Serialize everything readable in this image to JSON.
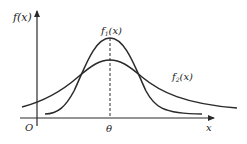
{
  "diagram": {
    "type": "normal-distribution-comparison",
    "y_axis_label": "f(x)",
    "x_axis_label": "x",
    "origin_label": "O",
    "mean_label": "θ",
    "curves": [
      {
        "name": "f1",
        "label_main": "f",
        "label_sub": "1",
        "label_tail": "(x)",
        "description": "taller, narrower bell curve centered at θ"
      },
      {
        "name": "f2",
        "label_main": "f",
        "label_sub": "2",
        "label_tail": "(x)",
        "description": "shorter, wider bell curve centered at θ"
      }
    ],
    "colors": {
      "stroke": "#2a2a2a",
      "background": "#ffffff"
    }
  }
}
